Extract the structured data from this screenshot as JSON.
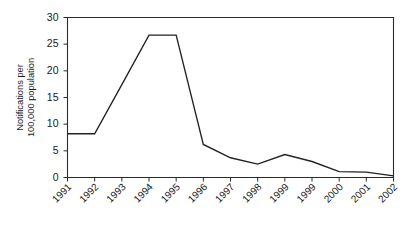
{
  "chart_data": {
    "type": "line",
    "title": "",
    "xlabel": "",
    "ylabel": "Notifications per 100,000 population",
    "ylabel_line1": "Notifications per",
    "ylabel_line2": "100,000 population",
    "categories": [
      "1991",
      "1992",
      "1993",
      "1994",
      "1995",
      "1996",
      "1997",
      "1998",
      "1999",
      "1999",
      "2000",
      "2001",
      "2002"
    ],
    "values": [
      8.2,
      8.2,
      17.4,
      26.7,
      26.7,
      6.2,
      3.7,
      2.5,
      4.3,
      3.0,
      1.1,
      1.0,
      0.3
    ],
    "ylim": [
      0,
      30
    ],
    "yticks": [
      0,
      5,
      10,
      15,
      20,
      25,
      30
    ],
    "ytick_labels": [
      "0",
      "5",
      "10",
      "15",
      "20",
      "25",
      "30"
    ],
    "grid": false,
    "legend": false,
    "legend_position": "none",
    "line_color": "#222222",
    "axis_color": "#2b2b2b",
    "xtick_rotation": -45,
    "series": [
      {
        "name": "Notifications per 100,000 population",
        "values": [
          8.2,
          8.2,
          17.4,
          26.7,
          26.7,
          6.2,
          3.7,
          2.5,
          4.3,
          3.0,
          1.1,
          1.0,
          0.3
        ]
      }
    ],
    "annotations": []
  }
}
